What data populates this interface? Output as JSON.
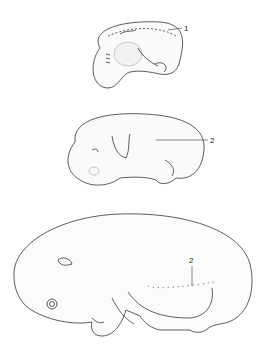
{
  "figure": {
    "labels": [
      {
        "id": "label-1",
        "text": "1",
        "stage": "early embryo (top)"
      },
      {
        "id": "label-2a",
        "text": "2",
        "stage": "middle embryo"
      },
      {
        "id": "label-2b",
        "text": "2",
        "stage": "late fetus (bottom)"
      }
    ]
  }
}
